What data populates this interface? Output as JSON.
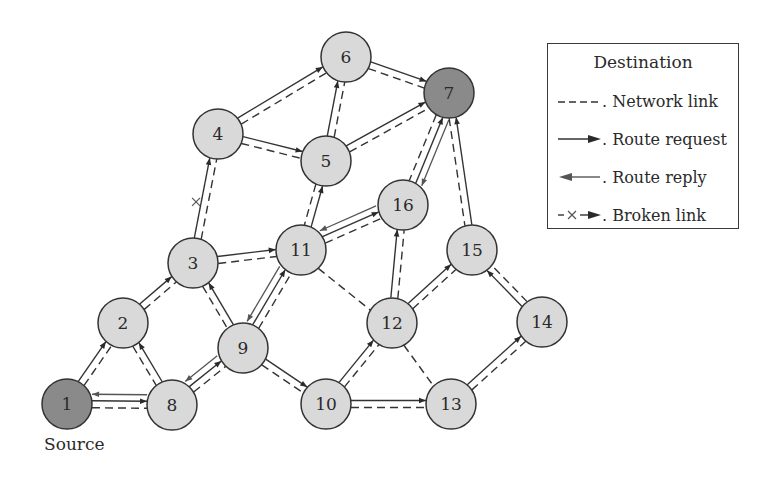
{
  "figure": {
    "source_label": "Source",
    "colors": {
      "endpoint_fill": "#8a8a8a",
      "node_fill": "#d9d9d9",
      "stroke": "#333333"
    }
  },
  "legend": {
    "title": "Destination",
    "items": [
      {
        "symbol": "dashed-line",
        "label": ". Network link"
      },
      {
        "symbol": "solid-arrow-right",
        "label": ". Route request"
      },
      {
        "symbol": "solid-arrow-left",
        "label": ". Route reply"
      },
      {
        "symbol": "x-arrow",
        "label": ". Broken link"
      }
    ]
  },
  "nodes": [
    {
      "id": "1",
      "x": 67,
      "y": 404,
      "role": "source"
    },
    {
      "id": "2",
      "x": 123,
      "y": 323
    },
    {
      "id": "3",
      "x": 193,
      "y": 263
    },
    {
      "id": "4",
      "x": 218,
      "y": 134
    },
    {
      "id": "5",
      "x": 326,
      "y": 161
    },
    {
      "id": "6",
      "x": 346,
      "y": 57
    },
    {
      "id": "7",
      "x": 449,
      "y": 93,
      "role": "destination"
    },
    {
      "id": "8",
      "x": 172,
      "y": 405
    },
    {
      "id": "9",
      "x": 243,
      "y": 348
    },
    {
      "id": "10",
      "x": 326,
      "y": 404
    },
    {
      "id": "11",
      "x": 301,
      "y": 250
    },
    {
      "id": "12",
      "x": 392,
      "y": 323
    },
    {
      "id": "13",
      "x": 451,
      "y": 404
    },
    {
      "id": "14",
      "x": 542,
      "y": 322
    },
    {
      "id": "15",
      "x": 472,
      "y": 250
    },
    {
      "id": "16",
      "x": 403,
      "y": 205
    }
  ],
  "edges": [
    {
      "from": "1",
      "to": "2",
      "link": true,
      "request": true
    },
    {
      "from": "1",
      "to": "8",
      "link": true,
      "request": true
    },
    {
      "from": "8",
      "to": "1",
      "reply": true
    },
    {
      "from": "8",
      "to": "2",
      "link": true,
      "request": true
    },
    {
      "from": "2",
      "to": "3",
      "link": true,
      "request": true
    },
    {
      "from": "3",
      "to": "4",
      "link": true,
      "request": true,
      "broken": true
    },
    {
      "from": "4",
      "to": "6",
      "link": true,
      "request": true
    },
    {
      "from": "4",
      "to": "5",
      "link": true,
      "request": true
    },
    {
      "from": "5",
      "to": "6",
      "link": true,
      "request": true
    },
    {
      "from": "6",
      "to": "7",
      "link": true,
      "request": true
    },
    {
      "from": "5",
      "to": "7",
      "link": true,
      "request": true
    },
    {
      "from": "3",
      "to": "11",
      "link": true,
      "request": true
    },
    {
      "from": "9",
      "to": "3",
      "link": true,
      "request": true
    },
    {
      "from": "8",
      "to": "9",
      "link": true,
      "request": true
    },
    {
      "from": "9",
      "to": "8",
      "reply": true
    },
    {
      "from": "9",
      "to": "11",
      "link": true,
      "request": true
    },
    {
      "from": "11",
      "to": "9",
      "reply": true
    },
    {
      "from": "11",
      "to": "5",
      "link": true,
      "request": true
    },
    {
      "from": "11",
      "to": "16",
      "link": true,
      "request": true
    },
    {
      "from": "16",
      "to": "11",
      "reply": true
    },
    {
      "from": "16",
      "to": "7",
      "link": true,
      "request": true
    },
    {
      "from": "7",
      "to": "16",
      "reply": true
    },
    {
      "from": "11",
      "to": "12",
      "link": true
    },
    {
      "from": "9",
      "to": "10",
      "link": true,
      "request": true
    },
    {
      "from": "10",
      "to": "12",
      "link": true,
      "request": true
    },
    {
      "from": "12",
      "to": "16",
      "link": true,
      "request": true
    },
    {
      "from": "12",
      "to": "15",
      "link": true,
      "request": true
    },
    {
      "from": "12",
      "to": "13",
      "link": true
    },
    {
      "from": "10",
      "to": "13",
      "link": true,
      "request": true
    },
    {
      "from": "13",
      "to": "14",
      "link": true,
      "request": true
    },
    {
      "from": "14",
      "to": "15",
      "link": true,
      "request": true
    },
    {
      "from": "15",
      "to": "7",
      "link": true,
      "request": true
    }
  ]
}
